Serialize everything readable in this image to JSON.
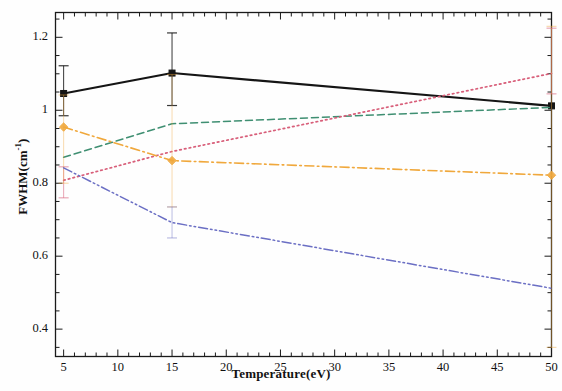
{
  "chart_data": {
    "type": "line",
    "title": "",
    "xlabel": "Temperature(eV)",
    "ylabel": "FWHM(cm-1)",
    "ylabel_base": "FWHM(cm",
    "ylabel_exp": "-1",
    "ylabel_tail": ")",
    "xlim": [
      4.25,
      50.0
    ],
    "ylim": [
      0.325,
      1.268
    ],
    "grid": false,
    "legend": "none",
    "xticks": [
      5,
      10,
      15,
      20,
      25,
      30,
      35,
      40,
      45,
      50
    ],
    "xtick_labels": [
      "5",
      "10",
      "15",
      "20",
      "25",
      "30",
      "35",
      "40",
      "45",
      "50"
    ],
    "xminor_step": 1,
    "yticks": [
      0.4,
      0.6,
      0.8,
      1.0,
      1.2
    ],
    "ytick_labels": [
      "0.4",
      "0.6",
      "0.8",
      "1",
      "1.2"
    ],
    "yminor_step": 0.05,
    "series": [
      {
        "name": "black-solid",
        "color": "#151515",
        "style": "solid",
        "width": 2.1,
        "marker": "square",
        "x": [
          5,
          15,
          50
        ],
        "values": [
          1.046,
          1.102,
          1.012
        ],
        "errors_up": [
          1.122,
          1.212,
          1.012
        ],
        "errors_down": [
          0.985,
          1.013,
          1.012
        ],
        "has_errorbars": true
      },
      {
        "name": "green-dashed",
        "color": "#3f8f72",
        "style": "dashed",
        "width": 1.5,
        "marker": "none",
        "x": [
          5,
          15,
          50
        ],
        "values": [
          0.871,
          0.963,
          1.008
        ],
        "has_errorbars": false
      },
      {
        "name": "red-dotted",
        "color": "#d85f7a",
        "style": "dotted",
        "width": 1.7,
        "marker": "none",
        "x": [
          5,
          15,
          50
        ],
        "values": [
          0.808,
          0.887,
          1.101
        ],
        "errors_up": [
          0.845,
          0.887,
          1.225
        ],
        "errors_down": [
          0.76,
          0.887,
          1.045
        ],
        "has_errorbars": true
      },
      {
        "name": "orange-dashdot",
        "color": "#f0a83c",
        "style": "dashdot",
        "width": 1.6,
        "marker": "diamond",
        "x": [
          5,
          15,
          50
        ],
        "values": [
          0.954,
          0.862,
          0.822
        ],
        "errors_up": [
          1.042,
          1.098,
          1.23
        ],
        "errors_down": [
          0.8,
          0.735,
          0.35
        ],
        "has_errorbars": true
      },
      {
        "name": "blue-dashdotdot",
        "color": "#6b6fc4",
        "style": "dashdotdot",
        "width": 1.5,
        "marker": "none",
        "x": [
          5,
          15,
          50
        ],
        "values": [
          0.842,
          0.692,
          0.512
        ],
        "errors_up": [
          0.842,
          0.735,
          0.512
        ],
        "errors_down": [
          0.842,
          0.65,
          0.512
        ],
        "has_errorbars": true
      }
    ]
  },
  "axes": {
    "frame_color": "#1a1a1a"
  }
}
